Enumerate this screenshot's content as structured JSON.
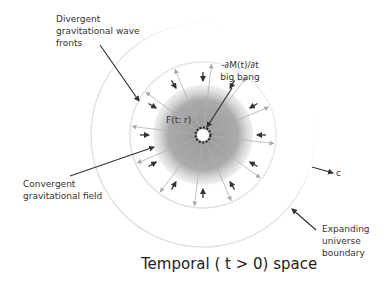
{
  "diagram": {
    "title": "Temporal ( t > 0) space",
    "labels": {
      "divergent": "Divergent\ngravitational wave\nfronts",
      "big_bang": "-∂M(t)/∂t\nbig bang",
      "field": "F(t: r)",
      "convergent": "Convergent\ngravitational field",
      "c": "c",
      "boundary": "Expanding\nuniverse\nboundary"
    },
    "geometry": {
      "center": [
        203,
        135
      ],
      "core_radius": 6,
      "disc_radius": 50,
      "wavefront_radius": 73,
      "boundary_radius": 112,
      "outward_ray_count": 12,
      "inward_arrow_count": 12
    },
    "colors": {
      "text": "#333333",
      "arrow": "#333333",
      "ray": "#b0b0b0",
      "disc": "#a8a8a8",
      "circle": "#e4e4e4"
    }
  }
}
